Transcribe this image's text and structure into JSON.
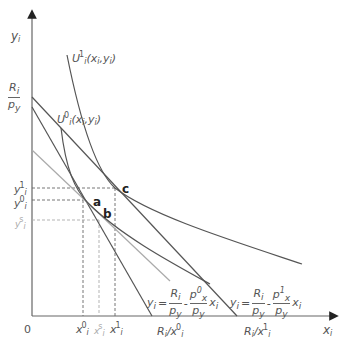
{
  "diagram": {
    "axes": {
      "y_label": "y",
      "y_label_sub": "i",
      "x_label": "x",
      "x_label_sub": "i",
      "origin_label": "0"
    },
    "y_intercept": {
      "num": "R",
      "num_sub": "i",
      "den": "p",
      "den_sub": "y"
    },
    "curves": {
      "u1": {
        "base": "U",
        "sub": "i",
        "sup": "1",
        "args": "(x",
        "args_sub": "i",
        "args2": ",y",
        "args2_sub": "i",
        "close": ")"
      },
      "u0": {
        "base": "U",
        "sub": "i",
        "sup": "0",
        "args": "(x",
        "args_sub": "i",
        "args2": ",y",
        "args2_sub": "i",
        "close": ")"
      }
    },
    "y_ticks": [
      {
        "base": "y",
        "sub": "i",
        "sup": "1"
      },
      {
        "base": "y",
        "sub": "i",
        "sup": "0"
      },
      {
        "base": "y",
        "sub": "i",
        "sup": "s"
      }
    ],
    "x_ticks": [
      {
        "base": "x",
        "sub": "i",
        "sup": "0"
      },
      {
        "base": "x",
        "sub": "i",
        "sup": "s"
      },
      {
        "base": "x",
        "sub": "i",
        "sup": "1"
      }
    ],
    "x_intercepts": [
      {
        "text": "R",
        "sub": "i",
        "slash": "/x",
        "sub2": "i",
        "sup": "0"
      },
      {
        "text": "R",
        "sub": "i",
        "slash": "/x",
        "sub2": "i",
        "sup": "1"
      }
    ],
    "points": [
      "a",
      "b",
      "c"
    ],
    "equations": [
      {
        "lhs": "y",
        "lhs_sub": "i",
        "eq": "=",
        "f1_num": "R",
        "f1_num_sub": "i",
        "f1_den": "p",
        "f1_den_sub": "y",
        "minus": "-",
        "f2_num": "p",
        "f2_num_sub": "x",
        "f2_num_sup": "0",
        "f2_den": "p",
        "f2_den_sub": "y",
        "var": "x",
        "var_sub": "i"
      },
      {
        "lhs": "y",
        "lhs_sub": "i",
        "eq": "=",
        "f1_num": "R",
        "f1_num_sub": "i",
        "f1_den": "p",
        "f1_den_sub": "y",
        "minus": "-",
        "f2_num": "p",
        "f2_num_sub": "x",
        "f2_num_sup": "1",
        "f2_den": "p",
        "f2_den_sub": "y",
        "var": "x",
        "var_sub": "i"
      }
    ],
    "colors": {
      "line": "#555555",
      "gray_line": "#aaaaaa",
      "dash": "#666666"
    }
  }
}
